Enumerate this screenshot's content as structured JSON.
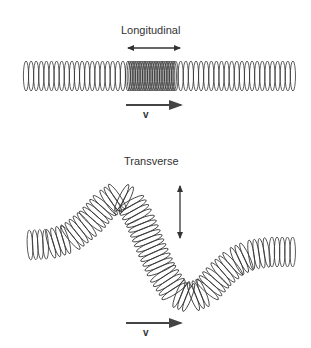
{
  "longitudinal": {
    "title": "Longitudinal",
    "velocity_label": "v",
    "oscillation_direction": "horizontal (double-headed arrow)",
    "propagation_direction": "right"
  },
  "transverse": {
    "title": "Transverse",
    "velocity_label": "v",
    "oscillation_direction": "vertical (double-headed arrow)",
    "propagation_direction": "right"
  },
  "colors": {
    "stroke": "#333333",
    "arrow": "#444444",
    "background": "#ffffff"
  }
}
